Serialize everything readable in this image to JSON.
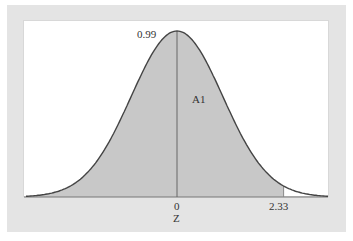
{
  "chart_data": {
    "type": "area",
    "title": "",
    "xlabel": "Z",
    "ylabel": "",
    "distribution": "standard normal",
    "x_ticks": [
      {
        "value": 0,
        "label": "0"
      },
      {
        "value": 2.33,
        "label": "2.33"
      }
    ],
    "x_range": [
      -3.3,
      3.3
    ],
    "shaded_region": {
      "from": -3.3,
      "to": 2.33,
      "label": "A1",
      "area": 0.99
    },
    "annotations": [
      {
        "text": "0.99",
        "position": "left of peak"
      },
      {
        "text": "A1",
        "position": "right of center line, inside shaded area"
      }
    ],
    "center_line_x": 0,
    "grid": false,
    "legend": null
  },
  "labels": {
    "peak_value": "0.99",
    "area_label": "A1",
    "tick_zero": "0",
    "tick_cutoff": "2.33",
    "axis_label": "Z"
  },
  "colors": {
    "panel_bg": "#e4e4e4",
    "plot_bg": "#ffffff",
    "shade": "#c8c8c8",
    "curve": "#444444"
  }
}
